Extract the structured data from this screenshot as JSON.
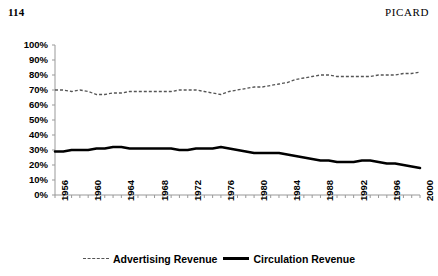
{
  "page": {
    "folio": "114",
    "running_title": "PICARD"
  },
  "legend": {
    "position": "bottom-center",
    "entries": [
      {
        "label": "Advertising Revenue",
        "style": "dashed-thin",
        "color": "#555555"
      },
      {
        "label": "Circulation Revenue",
        "style": "solid-thick",
        "color": "#000000"
      }
    ]
  },
  "chart_data": {
    "type": "line",
    "title": "",
    "subtitle": "",
    "xlabel": "",
    "ylabel": "",
    "grid": false,
    "xlim": [
      1956,
      2000
    ],
    "ylim": [
      0,
      100
    ],
    "ytick_labels": [
      "100%",
      "90%",
      "80%",
      "70%",
      "60%",
      "50%",
      "40%",
      "30%",
      "20%",
      "10%",
      "0%"
    ],
    "ytick_values": [
      100,
      90,
      80,
      70,
      60,
      50,
      40,
      30,
      20,
      10,
      0
    ],
    "xtick_labels": [
      "1956",
      "1960",
      "1964",
      "1968",
      "1972",
      "1976",
      "1980",
      "1984",
      "1988",
      "1992",
      "1996",
      "2000"
    ],
    "xtick_values": [
      1956,
      1960,
      1964,
      1968,
      1972,
      1976,
      1980,
      1984,
      1988,
      1992,
      1996,
      2000
    ],
    "x": [
      1956,
      1957,
      1958,
      1959,
      1960,
      1961,
      1962,
      1963,
      1964,
      1965,
      1966,
      1967,
      1968,
      1969,
      1970,
      1971,
      1972,
      1973,
      1974,
      1975,
      1976,
      1977,
      1978,
      1979,
      1980,
      1981,
      1982,
      1983,
      1984,
      1985,
      1986,
      1987,
      1988,
      1989,
      1990,
      1991,
      1992,
      1993,
      1994,
      1995,
      1996,
      1997,
      1998,
      1999,
      2000
    ],
    "series": [
      {
        "name": "Advertising Revenue",
        "style": "dashed-thin",
        "color": "#555555",
        "values": [
          70,
          70,
          69,
          70,
          69,
          67,
          67,
          68,
          68,
          69,
          69,
          69,
          69,
          69,
          69,
          70,
          70,
          70,
          69,
          68,
          67,
          69,
          70,
          71,
          72,
          72,
          73,
          74,
          75,
          77,
          78,
          79,
          80,
          80,
          79,
          79,
          79,
          79,
          79,
          80,
          80,
          80,
          81,
          81,
          82
        ]
      },
      {
        "name": "Circulation Revenue",
        "style": "solid-thick",
        "color": "#000000",
        "values": [
          29,
          29,
          30,
          30,
          30,
          31,
          31,
          32,
          32,
          31,
          31,
          31,
          31,
          31,
          31,
          30,
          30,
          31,
          31,
          31,
          32,
          31,
          30,
          29,
          28,
          28,
          28,
          28,
          27,
          26,
          25,
          24,
          23,
          23,
          22,
          22,
          22,
          23,
          23,
          22,
          21,
          21,
          20,
          19,
          18
        ]
      }
    ]
  }
}
